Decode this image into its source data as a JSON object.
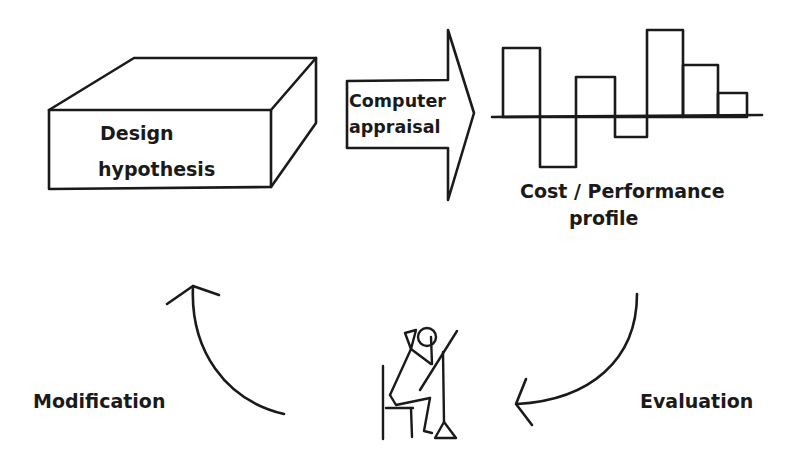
{
  "diagram": {
    "nodes": {
      "design_hypothesis": {
        "line1": "Design",
        "line2": "hypothesis"
      },
      "computer_appraisal": {
        "line1": "Computer",
        "line2": "appraisal"
      },
      "profile": {
        "line1": "Cost / Performance",
        "line2": "profile"
      },
      "evaluator_figure": {
        "description": "seated person thinking"
      }
    },
    "edges": [
      {
        "from": "design_hypothesis",
        "to": "profile",
        "label": "Computer appraisal"
      },
      {
        "from": "profile",
        "to": "evaluator_figure",
        "label": "Evaluation"
      },
      {
        "from": "evaluator_figure",
        "to": "design_hypothesis",
        "label": "Modification"
      }
    ],
    "labels": {
      "evaluation": "Evaluation",
      "modification": "Modification"
    },
    "colors": {
      "ink": "#1a1a1a",
      "background": "#ffffff"
    }
  },
  "chart_data": {
    "type": "bar",
    "title": "Cost / Performance profile",
    "categories": [
      "1",
      "2",
      "3",
      "4",
      "5",
      "6",
      "7"
    ],
    "values": [
      69,
      -50,
      40,
      -20,
      87,
      52,
      24
    ],
    "xlabel": "",
    "ylabel": "",
    "grid": false,
    "note": "Unlabeled schematic bars; values are relative heights in pixels above/below the baseline"
  }
}
